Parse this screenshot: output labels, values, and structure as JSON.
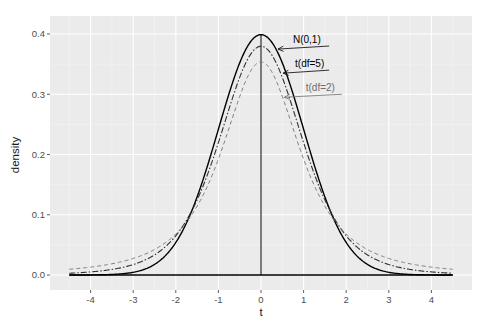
{
  "chart_data": {
    "type": "line",
    "title": "",
    "xlabel": "t",
    "ylabel": "density",
    "xlim": [
      -4.5,
      4.5
    ],
    "ylim": [
      -0.015,
      0.42
    ],
    "grid": true,
    "legend": "none (inline annotations with arrows)",
    "x_ticks": [
      -4,
      -3,
      -2,
      -1,
      0,
      1,
      2,
      3,
      4
    ],
    "x_tick_labels": [
      "-4",
      "-3",
      "-2",
      "-1",
      "0",
      "1",
      "2",
      "3",
      "4"
    ],
    "y_ticks": [
      0.0,
      0.1,
      0.2,
      0.3,
      0.4
    ],
    "y_tick_labels": [
      "0.0",
      "0.1",
      "0.2",
      "0.3",
      "0.4"
    ],
    "x": [
      -4.5,
      -4.25,
      -4.0,
      -3.75,
      -3.5,
      -3.25,
      -3.0,
      -2.75,
      -2.5,
      -2.25,
      -2.0,
      -1.75,
      -1.5,
      -1.25,
      -1.0,
      -0.75,
      -0.5,
      -0.25,
      0.0,
      0.25,
      0.5,
      0.75,
      1.0,
      1.25,
      1.5,
      1.75,
      2.0,
      2.25,
      2.5,
      2.75,
      3.0,
      3.25,
      3.5,
      3.75,
      4.0,
      4.25,
      4.5
    ],
    "series": [
      {
        "name": "N(0,1)",
        "linestyle": "solid",
        "color": "#000000",
        "values": [
          1.6e-05,
          4.8e-05,
          0.000134,
          0.000353,
          0.000873,
          0.002029,
          0.004432,
          0.009094,
          0.017528,
          0.03174,
          0.053991,
          0.086277,
          0.129518,
          0.182649,
          0.241971,
          0.301137,
          0.352065,
          0.386668,
          0.398942,
          0.386668,
          0.352065,
          0.301137,
          0.241971,
          0.182649,
          0.129518,
          0.086277,
          0.053991,
          0.03174,
          0.017528,
          0.009094,
          0.004432,
          0.002029,
          0.000873,
          0.000353,
          0.000134,
          4.8e-05,
          1.6e-05
        ]
      },
      {
        "name": "t(df=5)",
        "linestyle": "dotdash",
        "color": "#333333",
        "values": [
          0.00302,
          0.00382,
          0.00487,
          0.00627,
          0.00817,
          0.01076,
          0.01718,
          0.01957,
          0.027,
          0.03787,
          0.06509,
          0.07824,
          0.12451,
          0.16213,
          0.21968,
          0.27161,
          0.32036,
          0.36024,
          0.37961,
          0.36024,
          0.32036,
          0.27161,
          0.21968,
          0.16213,
          0.12451,
          0.07824,
          0.06509,
          0.03787,
          0.027,
          0.01957,
          0.01718,
          0.01076,
          0.00817,
          0.00627,
          0.00487,
          0.00382,
          0.00302
        ]
      },
      {
        "name": "t(df=2)",
        "linestyle": "dashed",
        "color": "#7f7f7f",
        "values": [
          0.00986,
          0.0114,
          0.01309,
          0.01521,
          0.01778,
          0.02092,
          0.02741,
          0.02977,
          0.03628,
          0.04454,
          0.06804,
          0.07184,
          0.09262,
          0.11894,
          0.19245,
          0.243,
          0.2963,
          0.33539,
          0.35355,
          0.33539,
          0.2963,
          0.243,
          0.19245,
          0.11894,
          0.09262,
          0.07184,
          0.06804,
          0.04454,
          0.03628,
          0.02977,
          0.02741,
          0.02092,
          0.01778,
          0.01521,
          0.01309,
          0.0114,
          0.00986
        ]
      }
    ],
    "reference_lines": [
      {
        "type": "horizontal",
        "y": 0,
        "x_from": -4.5,
        "x_to": 4.5
      },
      {
        "type": "vertical",
        "x": 0,
        "y_from": 0,
        "y_to": 0.4
      }
    ],
    "annotations": [
      {
        "text": "N(0,1)",
        "color": "#000000",
        "text_x": 0.75,
        "text_y": 0.385,
        "arrow_to_x": 0.4,
        "arrow_to_y": 0.375,
        "underline_to_x": 1.6
      },
      {
        "text": "t(df=5)",
        "color": "#000000",
        "text_x": 0.8,
        "text_y": 0.345,
        "arrow_to_x": 0.52,
        "arrow_to_y": 0.335,
        "underline_to_x": 1.6
      },
      {
        "text": "t(df=2)",
        "color": "#6e6e6e",
        "text_x": 1.05,
        "text_y": 0.305,
        "arrow_to_x": 0.55,
        "arrow_to_y": 0.295,
        "underline_to_x": 1.9
      }
    ]
  },
  "colors": {
    "panel_background": "#ebebeb",
    "grid_major": "#ffffff",
    "grid_minor": "#f5f5f5",
    "tick_label": "#4d4d4d",
    "axis_title": "#1a1a1a"
  }
}
